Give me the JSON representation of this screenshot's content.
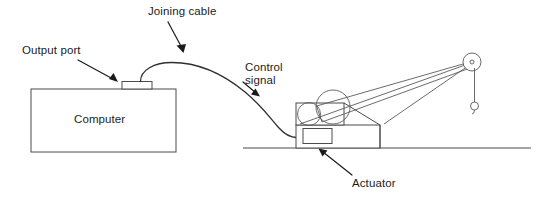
{
  "diagram": {
    "background_color": "#ffffff",
    "line_color": "#4b4b4b",
    "text_color": "#1c1c1c",
    "labels": {
      "joining_cable": "Joining cable",
      "output_port": "Output port",
      "control_signal_line1": "Control",
      "control_signal_line2": "signal",
      "actuator": "Actuator",
      "computer": "Computer"
    },
    "parts": {
      "computer_box": "Computer",
      "output_port_block": "Output port",
      "cable": "Joining cable",
      "actuator_block": "Actuator",
      "crane": "Crane",
      "ground": "Ground line",
      "pulley": "Pulley wheel",
      "hook": "Hook",
      "drum_large": "Large drum",
      "drum_small": "Small drum",
      "boom": "Boom arm"
    }
  }
}
